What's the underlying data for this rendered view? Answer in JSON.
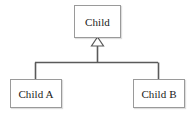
{
  "diagram": {
    "type": "uml-class-diagram",
    "background_color": "#ffffff",
    "line_color": "#5a5a5a",
    "border_color": "#9a9a9a",
    "text_color": "#1a1a1a",
    "nodes": {
      "parent": {
        "id": "child",
        "label": "Child",
        "role": "superclass"
      },
      "child_a": {
        "id": "child-a",
        "label": "Child A",
        "role": "subclass"
      },
      "child_b": {
        "id": "child-b",
        "label": "Child B",
        "role": "subclass"
      }
    },
    "connector": {
      "kind": "generalization",
      "arrowhead": "hollow-triangle",
      "style": "orthogonal-fork",
      "from": [
        "Child A",
        "Child B"
      ],
      "to": "Child"
    }
  }
}
